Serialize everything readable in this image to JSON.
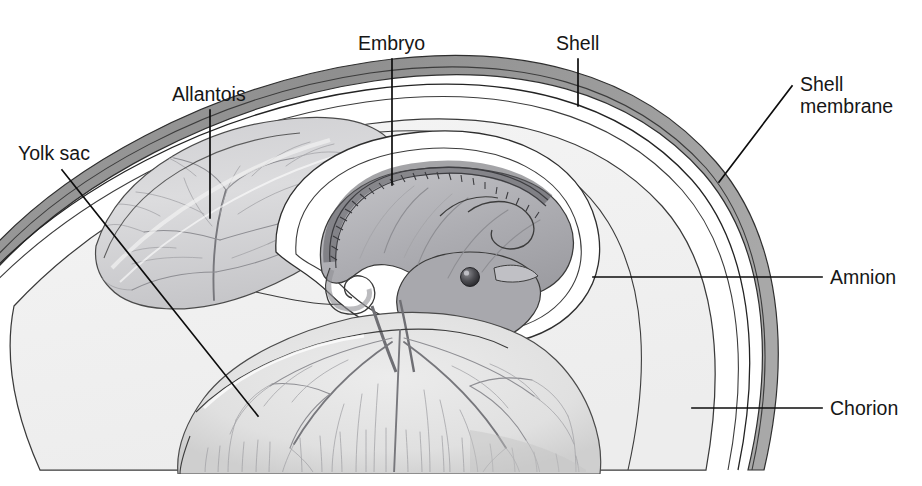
{
  "figure": {
    "background_color": "#ffffff",
    "width": 922,
    "height": 486,
    "ink_color": "#3c3c3c",
    "label_color": "#161616",
    "leader_color": "#0d0d0d"
  },
  "labels": [
    {
      "id": "yolk-sac",
      "text": "Yolk sac",
      "lines": [
        "Yolk sac"
      ],
      "text_x": 18,
      "text_y": 160,
      "anchor": "start",
      "leader": {
        "type": "diagonal",
        "x1": 62,
        "y1": 170,
        "x2": 258,
        "y2": 416
      }
    },
    {
      "id": "allantois",
      "text": "Allantois",
      "lines": [
        "Allantois"
      ],
      "text_x": 172,
      "text_y": 101,
      "anchor": "start",
      "leader": {
        "type": "vertical",
        "x1": 210,
        "y1": 110,
        "x2": 210,
        "y2": 218
      }
    },
    {
      "id": "embryo",
      "text": "Embryo",
      "lines": [
        "Embryo"
      ],
      "text_x": 358,
      "text_y": 50,
      "anchor": "start",
      "leader": {
        "type": "vertical",
        "x1": 392,
        "y1": 59,
        "x2": 392,
        "y2": 185
      }
    },
    {
      "id": "shell",
      "text": "Shell",
      "lines": [
        "Shell"
      ],
      "text_x": 556,
      "text_y": 50,
      "anchor": "start",
      "leader": {
        "type": "vertical",
        "x1": 578,
        "y1": 59,
        "x2": 578,
        "y2": 106
      }
    },
    {
      "id": "shell-membrane",
      "text": "Shell membrane",
      "lines": [
        "Shell",
        "membrane"
      ],
      "text_x": 800,
      "text_y": 91,
      "anchor": "start",
      "leader": {
        "type": "diagonal",
        "x1": 792,
        "y1": 86,
        "x2": 719,
        "y2": 182
      }
    },
    {
      "id": "amnion",
      "text": "Amnion",
      "lines": [
        "Amnion"
      ],
      "text_x": 830,
      "text_y": 284,
      "anchor": "start",
      "leader": {
        "type": "horizontal",
        "x1": 593,
        "y1": 277,
        "x2": 822,
        "y2": 277
      }
    },
    {
      "id": "chorion",
      "text": "Chorion",
      "lines": [
        "Chorion"
      ],
      "text_x": 830,
      "text_y": 415,
      "anchor": "start",
      "leader": {
        "type": "horizontal",
        "x1": 692,
        "y1": 408,
        "x2": 822,
        "y2": 408
      }
    }
  ],
  "structures": [
    {
      "id": "shell",
      "name": "Shell",
      "fill": "#9a9a9a",
      "note": "outer curved band"
    },
    {
      "id": "shell-membrane",
      "name": "Shell membrane",
      "fill": "#d8d8d8",
      "note": "thin double line inside shell"
    },
    {
      "id": "chorion",
      "name": "Chorion",
      "fill": "#f1f1f1",
      "note": "large inner cavity boundary"
    },
    {
      "id": "allantois",
      "name": "Allantois",
      "fill": "#d9d9db",
      "note": "lens-shaped vascular sac, upper left"
    },
    {
      "id": "amnion",
      "name": "Amnion",
      "fill": "#ffffff",
      "note": "clear sac surrounding embryo"
    },
    {
      "id": "embryo",
      "name": "Embryo",
      "fill": "#b4b4b8",
      "note": "curled chick with vertebral column and eye"
    },
    {
      "id": "yolk-sac",
      "name": "Yolk sac",
      "fill": "#e2e2e2",
      "note": "large vascularized mass, lower center"
    }
  ]
}
